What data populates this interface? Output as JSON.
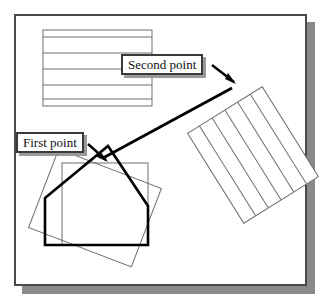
{
  "figure": {
    "callouts": [
      {
        "id": "first-point",
        "text": "First point"
      },
      {
        "id": "second-point",
        "text": "Second point"
      }
    ],
    "colors": {
      "frame_border": "#4a4a4a",
      "frame_shadow": "#8a8a8a",
      "thin_line": "#6f6f6f",
      "thick_line": "#000000",
      "label_border": "#3a3a3a",
      "label_shadow": "#9a9a9a",
      "background": "#ffffff"
    },
    "shapes": [
      {
        "name": "hatched-rectangle-top",
        "type": "rectangle",
        "hatch": "horizontal",
        "x": 43,
        "y": 30,
        "width": 109,
        "height": 76,
        "hatch_lines": 5
      },
      {
        "name": "hatched-rectangle-rotated",
        "type": "rectangle",
        "hatch": "parallel",
        "rotation_deg": -32,
        "hatch_lines": 5
      },
      {
        "name": "thin-rectangle-axis-aligned",
        "type": "rectangle",
        "x": 62,
        "y": 163,
        "width": 86,
        "height": 82
      },
      {
        "name": "thin-rectangle-rotated",
        "type": "rectangle",
        "rotation_deg": 21
      },
      {
        "name": "thick-polygon",
        "type": "polygon",
        "vertices": "45,198 108,146 148,206 148,245 45,245"
      },
      {
        "name": "thick-diagonal-arrow",
        "type": "line",
        "from": "first-point",
        "to": "second-point"
      }
    ]
  }
}
